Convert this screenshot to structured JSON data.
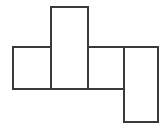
{
  "figure": {
    "background_color": "#ffffff",
    "stroke_color": "#3a3a3a",
    "fill_color": "#ffffff",
    "stroke_width": 2,
    "canvas": {
      "width": 166,
      "height": 130
    }
  },
  "chart_data": {
    "type": "diagram",
    "xlabel": "",
    "ylabel": "",
    "xlim": [
      0,
      166
    ],
    "ylim": [
      0,
      130
    ],
    "grid": false,
    "legend": "none",
    "shapes": [
      {
        "name": "left-square",
        "kind": "rectangle",
        "x": 13,
        "y": 47,
        "width": 38,
        "height": 42,
        "fill": "#ffffff",
        "stroke": "#3a3a3a"
      },
      {
        "name": "center-tall-rectangle",
        "kind": "rectangle",
        "x": 51,
        "y": 7,
        "width": 37,
        "height": 82,
        "fill": "#ffffff",
        "stroke": "#3a3a3a"
      },
      {
        "name": "upper-right-rectangle",
        "kind": "rectangle",
        "x": 88,
        "y": 47,
        "width": 70,
        "height": 42,
        "fill": "#ffffff",
        "stroke": "#3a3a3a"
      },
      {
        "name": "lower-right-rectangle",
        "kind": "rectangle",
        "x": 124,
        "y": 47,
        "width": 34,
        "height": 75,
        "fill": "#ffffff",
        "stroke": "#3a3a3a"
      }
    ],
    "outline_path": "M 13 47 L 51 47 L 51 7 L 88 7 L 88 47 L 158 47 L 158 122 L 124 122 L 124 89 L 13 89 Z",
    "internal_segments": [
      {
        "name": "left-square-right-edge",
        "x1": 51,
        "y1": 47,
        "x2": 51,
        "y2": 89
      },
      {
        "name": "center-rect-right-edge",
        "x1": 88,
        "y1": 47,
        "x2": 88,
        "y2": 89
      },
      {
        "name": "right-rect-left-edge",
        "x1": 124,
        "y1": 47,
        "x2": 124,
        "y2": 89
      }
    ]
  }
}
